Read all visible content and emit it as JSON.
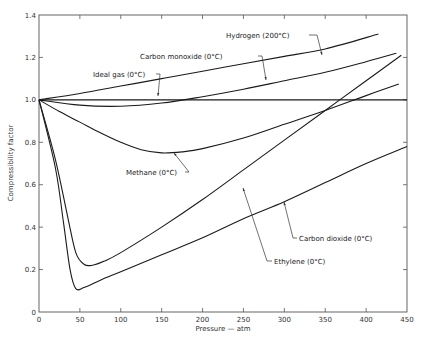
{
  "chart_data": {
    "type": "line",
    "title": "",
    "xlabel": "Pressure — atm",
    "ylabel": "Compressibility factor",
    "xlim": [
      0,
      450
    ],
    "ylim": [
      0,
      1.4
    ],
    "grid": false,
    "legend": "inline labels with leader arrows",
    "x_ticks": [
      0,
      50,
      100,
      150,
      200,
      250,
      300,
      350,
      400,
      450
    ],
    "y_ticks": [
      0,
      0.2,
      0.4,
      0.6,
      0.8,
      1.0,
      1.2,
      1.4
    ],
    "x_tick_labels": [
      "0",
      "50",
      "100",
      "150",
      "200",
      "250",
      "300",
      "350",
      "400",
      "450"
    ],
    "y_tick_labels": [
      "0",
      "0.2",
      "0.4",
      "0.6",
      "0.8",
      "1.0",
      "1.2",
      "1.4"
    ],
    "series": [
      {
        "name": "Hydrogen (200°C)",
        "x": [
          0,
          50,
          100,
          150,
          200,
          250,
          300,
          350,
          415
        ],
        "y": [
          1.0,
          1.03,
          1.065,
          1.1,
          1.135,
          1.17,
          1.205,
          1.24,
          1.31
        ]
      },
      {
        "name": "Carbon monoxide (0°C)",
        "x": [
          0,
          50,
          100,
          150,
          200,
          250,
          300,
          350,
          400,
          437
        ],
        "y": [
          1.0,
          0.975,
          0.97,
          0.985,
          1.015,
          1.05,
          1.09,
          1.13,
          1.18,
          1.22
        ]
      },
      {
        "name": "Ideal gas (0°C)",
        "x": [
          0,
          450
        ],
        "y": [
          1.0,
          1.0
        ]
      },
      {
        "name": "Methane (0°C)",
        "x": [
          0,
          25,
          50,
          75,
          100,
          125,
          150,
          175,
          200,
          250,
          300,
          350,
          400,
          440
        ],
        "y": [
          1.0,
          0.945,
          0.895,
          0.845,
          0.8,
          0.765,
          0.75,
          0.755,
          0.77,
          0.82,
          0.885,
          0.95,
          1.02,
          1.075
        ]
      },
      {
        "name": "Ethylene (0°C)",
        "x": [
          0,
          20,
          35,
          45,
          55,
          65,
          80,
          100,
          150,
          200,
          250,
          300,
          350,
          400,
          443
        ],
        "y": [
          1.0,
          0.72,
          0.45,
          0.28,
          0.225,
          0.22,
          0.24,
          0.28,
          0.4,
          0.53,
          0.67,
          0.81,
          0.95,
          1.09,
          1.21
        ]
      },
      {
        "name": "Carbon dioxide (0°C)",
        "x": [
          0,
          20,
          30,
          38,
          45,
          55,
          75,
          100,
          150,
          200,
          250,
          300,
          350,
          400,
          450
        ],
        "y": [
          1.0,
          0.68,
          0.42,
          0.2,
          0.11,
          0.115,
          0.15,
          0.19,
          0.27,
          0.35,
          0.44,
          0.52,
          0.61,
          0.7,
          0.78
        ]
      }
    ],
    "annotations": [
      {
        "text": "Hydrogen (200°C)",
        "target_series": "Hydrogen (200°C)",
        "pointer_at": [
          235,
          1.155
        ]
      },
      {
        "text": "Carbon monoxide (0°C)",
        "target_series": "Carbon monoxide (0°C)",
        "pointer_at": [
          250,
          1.05
        ]
      },
      {
        "text": "Ideal gas (0°C)",
        "target_series": "Carbon monoxide (0°C)",
        "pointer_at": [
          145,
          0.985
        ]
      },
      {
        "text": "Methane (0°C)",
        "target_series": "Methane (0°C)",
        "pointer_at": [
          165,
          0.755
        ]
      },
      {
        "text": "Carbon dioxide (0°C)",
        "target_series": "Carbon dioxide (0°C)",
        "pointer_at": [
          300,
          0.52
        ]
      },
      {
        "text": "Ethylene (0°C)",
        "target_series": "Ethylene (0°C)",
        "pointer_at": [
          220,
          0.58
        ]
      }
    ]
  },
  "labels": {
    "xlabel": "Pressure — atm",
    "ylabel": "Compressibility factor",
    "hydrogen": "Hydrogen (200°C)",
    "carbon_monoxide": "Carbon monoxide (0°C)",
    "ideal_gas": "Ideal gas (0°C)",
    "methane": "Methane (0°C)",
    "carbon_dioxide": "Carbon dioxide (0°C)",
    "ethylene": "Ethylene (0°C)"
  }
}
